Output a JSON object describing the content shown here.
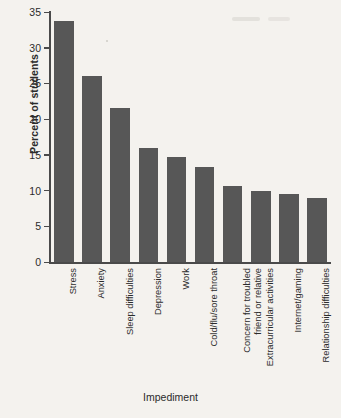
{
  "chart_data": {
    "type": "bar",
    "title": "",
    "xlabel": "Impediment",
    "ylabel": "Percent of students",
    "ylim": [
      0,
      35
    ],
    "yticks": [
      0,
      5,
      10,
      15,
      20,
      25,
      30,
      35
    ],
    "grid": false,
    "legend": null,
    "bar_color": "#575757",
    "background_color": "#f4f2ee",
    "categories": [
      "Stress",
      "Anxiety",
      "Sleep difficulties",
      "Depression",
      "Work",
      "Cold/flu/sore throat",
      "Concern for troubled\nfriend or relative",
      "Extracurricular activities",
      "Internet/gaming",
      "Relationship difficulties"
    ],
    "values": [
      33.8,
      26.1,
      21.6,
      16.0,
      14.7,
      13.3,
      10.6,
      9.9,
      9.5,
      8.9
    ]
  },
  "axis": {
    "y_title": "Percent of students",
    "x_title": "Impediment",
    "tick_labels": [
      "0",
      "5",
      "10",
      "15",
      "20",
      "25",
      "30",
      "35"
    ]
  },
  "bars": [
    {
      "label": "Stress",
      "value": 33.8
    },
    {
      "label": "Anxiety",
      "value": 26.1
    },
    {
      "label": "Sleep difficulties",
      "value": 21.6
    },
    {
      "label": "Depression",
      "value": 16.0
    },
    {
      "label": "Work",
      "value": 14.7
    },
    {
      "label": "Cold/flu/sore throat",
      "value": 13.3
    },
    {
      "label": "Concern for troubled\nfriend or relative",
      "value": 10.6
    },
    {
      "label": "Extracurricular activities",
      "value": 9.9
    },
    {
      "label": "Internet/gaming",
      "value": 9.5
    },
    {
      "label": "Relationship difficulties",
      "value": 8.9
    }
  ]
}
